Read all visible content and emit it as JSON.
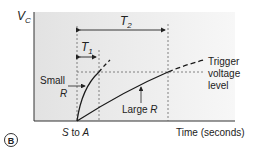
{
  "figure": {
    "panel_label": "B",
    "y_axis_label": "V",
    "y_axis_subscript": "C",
    "x_axis_label": "Time (seconds)",
    "origin_label_s": "S",
    "origin_label_to": " to ",
    "origin_label_a": "A",
    "t1_label": "T",
    "t1_subscript": "1",
    "t2_label": "T",
    "t2_subscript": "2",
    "small_r_label_line1": "Small",
    "small_r_label_line2": "R",
    "large_r_label_text": "Large ",
    "large_r_label_r": "R",
    "trigger_label_line1": "Trigger",
    "trigger_label_line2": "voltage",
    "trigger_label_line3": "level",
    "colors": {
      "background_left": "#e4e4e4",
      "background_right": "#f6f6f6",
      "curve": "#1a1a1a",
      "dashed": "#555555",
      "badge_border": "#333333"
    }
  }
}
